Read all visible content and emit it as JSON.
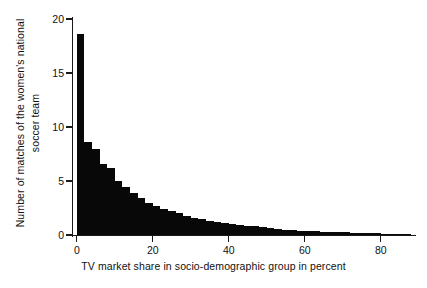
{
  "chart_data": {
    "type": "bar",
    "title": "",
    "subtitle": "",
    "xlabel": "TV market share in socio-demographic group in percent",
    "ylabel": "Number of matches of the women's national soccer team",
    "ylabel_line1": "Number of matches of the women's national",
    "ylabel_line2": "soccer team",
    "xlim": [
      -1,
      89
    ],
    "ylim": [
      0,
      20
    ],
    "grid": false,
    "legend": null,
    "bin_width": 2,
    "bar_color": "#080808",
    "axis_color": "#1a1a1a",
    "background": "#ffffff",
    "xticks": [
      0,
      20,
      40,
      60,
      80
    ],
    "xtick_labels": [
      "0",
      "20",
      "40",
      "60",
      "80"
    ],
    "yticks": [
      0,
      5,
      10,
      15,
      20
    ],
    "ytick_labels": [
      "0",
      "5",
      "10",
      "15",
      "20"
    ],
    "x": [
      0,
      2,
      4,
      6,
      8,
      10,
      12,
      14,
      16,
      18,
      20,
      22,
      24,
      26,
      28,
      30,
      32,
      34,
      36,
      38,
      40,
      42,
      44,
      46,
      48,
      50,
      52,
      54,
      56,
      58,
      60,
      62,
      64,
      66,
      68,
      70,
      72,
      74,
      76,
      78,
      80,
      82,
      84,
      86
    ],
    "values": [
      18.6,
      8.6,
      8.0,
      6.6,
      6.2,
      5.0,
      4.4,
      3.9,
      3.4,
      3.0,
      2.7,
      2.4,
      2.2,
      2.0,
      1.8,
      1.6,
      1.5,
      1.3,
      1.2,
      1.1,
      1.0,
      0.9,
      0.85,
      0.8,
      0.7,
      0.62,
      0.55,
      0.5,
      0.45,
      0.4,
      0.36,
      0.33,
      0.3,
      0.28,
      0.26,
      0.24,
      0.22,
      0.2,
      0.19,
      0.17,
      0.14,
      0.1,
      0.07,
      0.04
    ]
  }
}
